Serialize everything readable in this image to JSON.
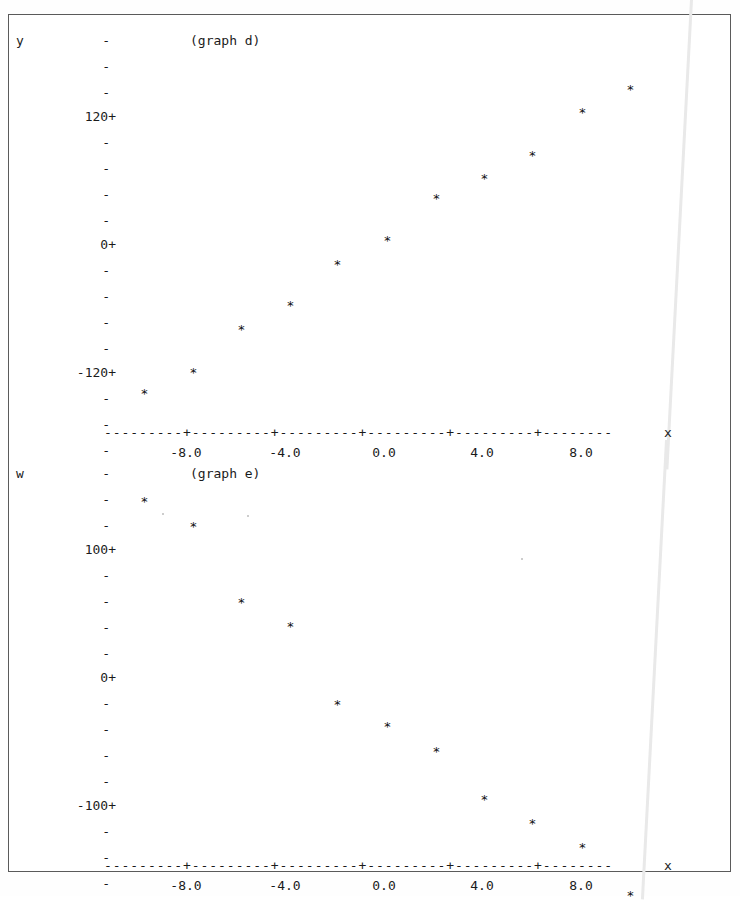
{
  "page": {
    "background_color": "#ffffff",
    "ink_color": "#1b1b1b",
    "frame_color": "#5a5a5a",
    "streak_color": "#e9e9e9"
  },
  "graphs": [
    {
      "id": "graph-d",
      "title": "(graph d)",
      "y_axis_label": "y",
      "x_axis_label": "x",
      "tick_glyph": "-",
      "labeled_tick_glyph": "+",
      "axis_line": "---------+---------+---------+---------+---------+--------",
      "y_ticks": [
        {
          "label": "",
          "glyph": "-",
          "y": 12
        },
        {
          "label": "",
          "glyph": "-",
          "y": 38
        },
        {
          "label": "",
          "glyph": "-",
          "y": 64
        },
        {
          "label": "120",
          "glyph": "+",
          "y": 88
        },
        {
          "label": "",
          "glyph": "-",
          "y": 114
        },
        {
          "label": "",
          "glyph": "-",
          "y": 140
        },
        {
          "label": "",
          "glyph": "-",
          "y": 166
        },
        {
          "label": "",
          "glyph": "-",
          "y": 192
        },
        {
          "label": "0",
          "glyph": "+",
          "y": 216
        },
        {
          "label": "",
          "glyph": "-",
          "y": 242
        },
        {
          "label": "",
          "glyph": "-",
          "y": 268
        },
        {
          "label": "",
          "glyph": "-",
          "y": 294
        },
        {
          "label": "",
          "glyph": "-",
          "y": 320
        },
        {
          "label": "-120",
          "glyph": "+",
          "y": 344
        },
        {
          "label": "",
          "glyph": "-",
          "y": 370
        },
        {
          "label": "",
          "glyph": "-",
          "y": 396
        },
        {
          "label": "",
          "glyph": "-",
          "y": 422
        }
      ],
      "x_tick_labels": [
        "-8.0",
        "-4.0",
        "0.0",
        "4.0",
        "8.0"
      ]
    },
    {
      "id": "graph-e",
      "title": "(graph e)",
      "y_axis_label": "w",
      "x_axis_label": "x",
      "tick_glyph": "-",
      "labeled_tick_glyph": "+",
      "axis_line": "---------+---------+---------+---------+---------+--------",
      "y_ticks": [
        {
          "label": "",
          "glyph": "-",
          "y": 12
        },
        {
          "label": "",
          "glyph": "-",
          "y": 38
        },
        {
          "label": "",
          "glyph": "-",
          "y": 64
        },
        {
          "label": "100",
          "glyph": "+",
          "y": 88
        },
        {
          "label": "",
          "glyph": "-",
          "y": 114
        },
        {
          "label": "",
          "glyph": "-",
          "y": 140
        },
        {
          "label": "",
          "glyph": "-",
          "y": 166
        },
        {
          "label": "",
          "glyph": "-",
          "y": 192
        },
        {
          "label": "0",
          "glyph": "+",
          "y": 216
        },
        {
          "label": "",
          "glyph": "-",
          "y": 242
        },
        {
          "label": "",
          "glyph": "-",
          "y": 268
        },
        {
          "label": "",
          "glyph": "-",
          "y": 294
        },
        {
          "label": "",
          "glyph": "-",
          "y": 320
        },
        {
          "label": "-100",
          "glyph": "+",
          "y": 344
        },
        {
          "label": "",
          "glyph": "-",
          "y": 370
        },
        {
          "label": "",
          "glyph": "-",
          "y": 396
        },
        {
          "label": "",
          "glyph": "-",
          "y": 422
        }
      ],
      "x_tick_labels": [
        "-8.0",
        "-4.0",
        "0.0",
        "4.0",
        "8.0"
      ]
    }
  ],
  "chart_data": [
    {
      "type": "scatter",
      "title": "(graph d)",
      "xlabel": "x",
      "ylabel": "y",
      "marker": "*",
      "grid": false,
      "legend": null,
      "xlim": [
        -10.0,
        10.0
      ],
      "ylim": [
        -200.0,
        200.0
      ],
      "xticks": [
        -8.0,
        -4.0,
        0.0,
        4.0,
        8.0
      ],
      "yticks": [
        120,
        0,
        -120
      ],
      "x": [
        -9.5,
        -7.8,
        -6.0,
        -4.2,
        -2.5,
        -1.3,
        0.2,
        2.2,
        4.3,
        6.4,
        9.0
      ],
      "y": [
        -152,
        -128,
        -92,
        -70,
        -40,
        -18,
        6,
        38,
        62,
        88,
        132
      ],
      "points": [
        {
          "x": -9.5,
          "y": -152
        },
        {
          "x": -7.8,
          "y": -128
        },
        {
          "x": -6.0,
          "y": -92
        },
        {
          "x": -4.2,
          "y": -70
        },
        {
          "x": -2.5,
          "y": -40
        },
        {
          "x": -1.3,
          "y": -18
        },
        {
          "x": 0.2,
          "y": 6
        },
        {
          "x": 2.2,
          "y": 38
        },
        {
          "x": 4.3,
          "y": 62
        },
        {
          "x": 6.4,
          "y": 88
        },
        {
          "x": 9.0,
          "y": 132
        }
      ],
      "pixel_points": [
        {
          "x": 140,
          "y": 365
        },
        {
          "x": 189,
          "y": 344
        },
        {
          "x": 237,
          "y": 301
        },
        {
          "x": 286,
          "y": 277
        },
        {
          "x": 333,
          "y": 236
        },
        {
          "x": 383,
          "y": 212
        },
        {
          "x": 432,
          "y": 170
        },
        {
          "x": 480,
          "y": 150
        },
        {
          "x": 528,
          "y": 127
        },
        {
          "x": 578,
          "y": 84
        },
        {
          "x": 626,
          "y": 61
        }
      ]
    },
    {
      "type": "scatter",
      "title": "(graph e)",
      "xlabel": "x",
      "ylabel": "w",
      "marker": "*",
      "grid": false,
      "legend": null,
      "xlim": [
        -10.0,
        10.0
      ],
      "ylim": [
        -175.0,
        175.0
      ],
      "xticks": [
        -8.0,
        -4.0,
        0.0,
        4.0,
        8.0
      ],
      "yticks": [
        100,
        0,
        -100
      ],
      "x": [
        -9.5,
        -7.8,
        -6.0,
        -4.2,
        -2.5,
        -1.3,
        0.2,
        2.2,
        4.3,
        6.4,
        9.0
      ],
      "y": [
        150,
        128,
        78,
        60,
        12,
        -5,
        -28,
        -62,
        -85,
        -100,
        -140
      ],
      "points": [
        {
          "x": -9.5,
          "y": 150
        },
        {
          "x": -7.8,
          "y": 128
        },
        {
          "x": -6.0,
          "y": 78
        },
        {
          "x": -4.2,
          "y": 60
        },
        {
          "x": -2.5,
          "y": 12
        },
        {
          "x": -1.3,
          "y": -5
        },
        {
          "x": 0.2,
          "y": -28
        },
        {
          "x": 2.2,
          "y": -62
        },
        {
          "x": 4.3,
          "y": -85
        },
        {
          "x": 6.4,
          "y": -100
        },
        {
          "x": 9.0,
          "y": -140
        }
      ],
      "pixel_points": [
        {
          "x": 140,
          "y": 40
        },
        {
          "x": 189,
          "y": 65
        },
        {
          "x": 237,
          "y": 141
        },
        {
          "x": 286,
          "y": 165
        },
        {
          "x": 333,
          "y": 243
        },
        {
          "x": 383,
          "y": 265
        },
        {
          "x": 432,
          "y": 290
        },
        {
          "x": 480,
          "y": 338
        },
        {
          "x": 528,
          "y": 362
        },
        {
          "x": 578,
          "y": 386
        },
        {
          "x": 626,
          "y": 434
        }
      ]
    }
  ]
}
